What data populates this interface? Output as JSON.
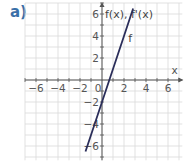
{
  "panel_label": "a)",
  "colors": {
    "grid": "#d9d9d9",
    "axis": "#555555",
    "line": "#2b2e5a",
    "label": "#3a6fa8"
  },
  "chart_data": {
    "type": "line",
    "title": "",
    "xlabel": "x",
    "ylabel": "f(x), f'(x)",
    "xlim": [
      -7,
      7
    ],
    "ylim": [
      -7,
      7
    ],
    "grid": true,
    "x_ticks": [
      -6,
      -4,
      -2,
      0,
      2,
      4,
      6
    ],
    "y_ticks": [
      -6,
      -4,
      -2,
      2,
      4,
      6
    ],
    "x_tick_labels": [
      "−6",
      "−4",
      "−2",
      "0",
      "2",
      "4",
      "6"
    ],
    "y_tick_labels": [
      "−6",
      "−4",
      "−2",
      "2",
      "4",
      "6"
    ],
    "series": [
      {
        "name": "f",
        "equation": "f(x) = 3x - 2",
        "x": [
          -1.5,
          0,
          2,
          2.83
        ],
        "y": [
          -6.5,
          -2,
          4,
          6.5
        ]
      }
    ],
    "annotations": [
      {
        "text": "f",
        "x": 2.2,
        "y": 3.8
      }
    ]
  }
}
